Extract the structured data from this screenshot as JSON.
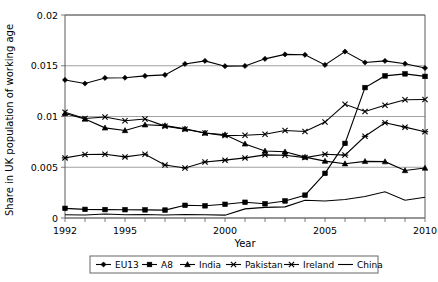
{
  "chart_data": {
    "type": "line",
    "title": "",
    "xlabel": "Year",
    "ylabel": "Share in UK population of working age",
    "xlim": [
      1992,
      2010
    ],
    "ylim": [
      0,
      0.02
    ],
    "grid": true,
    "legend_position": "bottom",
    "x": [
      1992,
      1993,
      1994,
      1995,
      1996,
      1997,
      1998,
      1999,
      2000,
      2001,
      2002,
      2003,
      2004,
      2005,
      2006,
      2007,
      2008,
      2009,
      2010
    ],
    "xticks": [
      "1992",
      "1995",
      "2000",
      "2005",
      "2010"
    ],
    "xtick_values": [
      1992,
      1995,
      2000,
      2005,
      2010
    ],
    "yticks": [
      "0",
      "0.005",
      "0.01",
      "0.015",
      "0.02"
    ],
    "ytick_values": [
      0,
      0.005,
      0.01,
      0.015,
      0.02
    ],
    "series": [
      {
        "name": "EU13",
        "marker": "diamond",
        "values": [
          0.0136,
          0.01325,
          0.0138,
          0.01382,
          0.014,
          0.0141,
          0.01518,
          0.01548,
          0.01496,
          0.01498,
          0.01568,
          0.01612,
          0.01608,
          0.01508,
          0.0164,
          0.01532,
          0.01548,
          0.0152,
          0.01478
        ]
      },
      {
        "name": "A8",
        "marker": "square",
        "values": [
          0.00095,
          0.00085,
          0.00083,
          0.00082,
          0.0008,
          0.00078,
          0.00125,
          0.0012,
          0.00135,
          0.00155,
          0.0014,
          0.00168,
          0.00225,
          0.0044,
          0.00735,
          0.01285,
          0.014,
          0.0142,
          0.01395
        ]
      },
      {
        "name": "India",
        "marker": "triangle",
        "values": [
          0.0103,
          0.00975,
          0.00888,
          0.00862,
          0.00918,
          0.0091,
          0.00878,
          0.00838,
          0.0082,
          0.0073,
          0.0066,
          0.00652,
          0.006,
          0.0056,
          0.00535,
          0.00558,
          0.00555,
          0.00468,
          0.00492
        ]
      },
      {
        "name": "Pakistan",
        "marker": "x",
        "values": [
          0.01042,
          0.0098,
          0.00995,
          0.00958,
          0.00975,
          0.00905,
          0.00875,
          0.00838,
          0.00812,
          0.00815,
          0.00825,
          0.00862,
          0.00852,
          0.00945,
          0.0112,
          0.0105,
          0.0111,
          0.01165,
          0.01168
        ]
      },
      {
        "name": "Ireland",
        "marker": "star",
        "values": [
          0.00592,
          0.00625,
          0.00628,
          0.00602,
          0.00628,
          0.00522,
          0.00492,
          0.00552,
          0.0057,
          0.00592,
          0.00622,
          0.00618,
          0.00595,
          0.00628,
          0.0062,
          0.00805,
          0.00938,
          0.00895,
          0.0085
        ]
      },
      {
        "name": "China",
        "marker": "none",
        "values": [
          0.00032,
          0.0003,
          0.0004,
          0.00032,
          0.00035,
          0.0003,
          0.00035,
          0.00032,
          0.00028,
          0.0009,
          0.00105,
          0.0011,
          0.00175,
          0.00168,
          0.00182,
          0.00212,
          0.00258,
          0.00175,
          0.00205
        ]
      }
    ]
  },
  "legend": {
    "items": [
      {
        "label": "EU13"
      },
      {
        "label": "A8"
      },
      {
        "label": "India"
      },
      {
        "label": "Pakistan"
      },
      {
        "label": "Ireland"
      },
      {
        "label": "China"
      }
    ]
  }
}
